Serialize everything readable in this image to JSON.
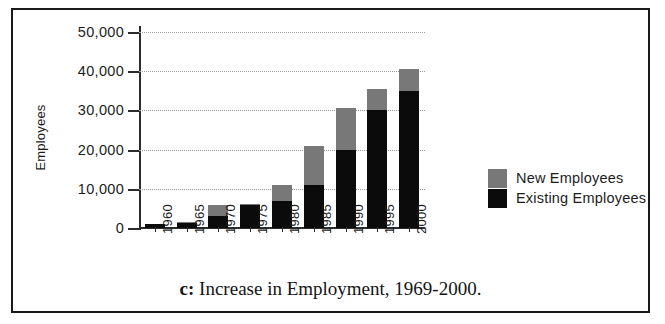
{
  "figure": {
    "caption_letter": "c:",
    "caption_text": "Increase in Employment, 1969-2000."
  },
  "legend": {
    "items": [
      {
        "label": "New Employees",
        "color": "#787878",
        "key": "new"
      },
      {
        "label": "Existing Employees",
        "color": "#0b0b0b",
        "key": "existing"
      }
    ]
  },
  "chart_data": {
    "type": "bar",
    "subtype": "stacked",
    "title": "",
    "xlabel": "",
    "ylabel": "Employees",
    "ylim": [
      0,
      50000
    ],
    "yticks": [
      0,
      10000,
      20000,
      30000,
      40000,
      50000
    ],
    "ytick_labels": [
      "0",
      "10,000",
      "20,000",
      "30,000",
      "40,000",
      "50,000"
    ],
    "grid": true,
    "grid_axis": "y",
    "grid_style": "dotted",
    "legend_position": "right",
    "categories": [
      "1960",
      "1965",
      "1970",
      "1975",
      "1980",
      "1985",
      "1990",
      "1995",
      "2000"
    ],
    "series": [
      {
        "name": "Existing Employees",
        "color": "#0b0b0b",
        "values": [
          1000,
          1200,
          3000,
          5800,
          7000,
          11000,
          20000,
          30000,
          35000
        ]
      },
      {
        "name": "New Employees",
        "color": "#787878",
        "values": [
          0,
          400,
          3000,
          400,
          4000,
          10000,
          10500,
          5500,
          5500
        ]
      }
    ],
    "totals": [
      1000,
      1600,
      6000,
      6200,
      11000,
      21000,
      30500,
      35500,
      40500
    ]
  }
}
